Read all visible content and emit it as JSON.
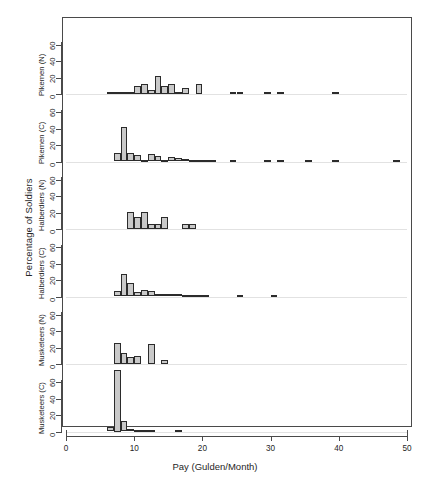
{
  "chart_data": {
    "type": "bar",
    "subtype": "histogram-small-multiples",
    "title": "",
    "xlabel": "Pay (Gulden/Month)",
    "ylabel": "Percentage of Soldiers",
    "xlim": [
      0,
      50
    ],
    "ylim": [
      0,
      80
    ],
    "xticks": [
      0,
      10,
      20,
      30,
      40,
      50
    ],
    "xticklabels": [
      "0",
      "10",
      "20",
      "30",
      "40",
      "50"
    ],
    "yticks": [
      0,
      20,
      40,
      60
    ],
    "yticklabels": [
      "0",
      "20",
      "40",
      "60"
    ],
    "grid": false,
    "legend": null,
    "bin_width": 1,
    "bar_fill": "#c9c9c9",
    "bar_edge": "#2b2b2b",
    "panels": [
      {
        "label": "Pikemen (N)",
        "order": 1,
        "bins": [
          {
            "x": 6,
            "value": 1.5
          },
          {
            "x": 7,
            "value": 2.0
          },
          {
            "x": 8,
            "value": 1.0
          },
          {
            "x": 9,
            "value": 1.5
          },
          {
            "x": 10,
            "value": 10.0
          },
          {
            "x": 11,
            "value": 12.0
          },
          {
            "x": 12,
            "value": 4.5
          },
          {
            "x": 13,
            "value": 22.0
          },
          {
            "x": 14,
            "value": 10.0
          },
          {
            "x": 15,
            "value": 12.5
          },
          {
            "x": 16,
            "value": 3.0
          },
          {
            "x": 17,
            "value": 7.5
          },
          {
            "x": 19,
            "value": 12.0
          },
          {
            "x": 24,
            "value": 1.2
          },
          {
            "x": 25,
            "value": 1.2
          },
          {
            "x": 29,
            "value": 1.2
          },
          {
            "x": 31,
            "value": 1.2
          },
          {
            "x": 39,
            "value": 1.2
          }
        ]
      },
      {
        "label": "Pikemen (C)",
        "order": 2,
        "bins": [
          {
            "x": 7,
            "value": 10.0
          },
          {
            "x": 8,
            "value": 42.0
          },
          {
            "x": 9,
            "value": 10.0
          },
          {
            "x": 10,
            "value": 8.0
          },
          {
            "x": 11,
            "value": 2.0
          },
          {
            "x": 12,
            "value": 9.0
          },
          {
            "x": 13,
            "value": 7.0
          },
          {
            "x": 14,
            "value": 2.0
          },
          {
            "x": 15,
            "value": 5.0
          },
          {
            "x": 16,
            "value": 4.0
          },
          {
            "x": 17,
            "value": 2.5
          },
          {
            "x": 18,
            "value": 2.0
          },
          {
            "x": 19,
            "value": 1.5
          },
          {
            "x": 20,
            "value": 1.2
          },
          {
            "x": 21,
            "value": 1.2
          },
          {
            "x": 24,
            "value": 1.2
          },
          {
            "x": 29,
            "value": 1.2
          },
          {
            "x": 31,
            "value": 1.2
          },
          {
            "x": 35,
            "value": 1.2
          },
          {
            "x": 39,
            "value": 1.2
          },
          {
            "x": 48,
            "value": 1.2
          }
        ]
      },
      {
        "label": "Halberdiers (N)",
        "order": 3,
        "bins": [
          {
            "x": 9,
            "value": 21.0
          },
          {
            "x": 10,
            "value": 15.0
          },
          {
            "x": 11,
            "value": 21.0
          },
          {
            "x": 12,
            "value": 6.5
          },
          {
            "x": 13,
            "value": 6.5
          },
          {
            "x": 14,
            "value": 14.5
          },
          {
            "x": 17,
            "value": 6.0
          },
          {
            "x": 18,
            "value": 6.0
          }
        ]
      },
      {
        "label": "Halberdiers (C)",
        "order": 4,
        "bins": [
          {
            "x": 7,
            "value": 7.0
          },
          {
            "x": 8,
            "value": 27.0
          },
          {
            "x": 9,
            "value": 17.0
          },
          {
            "x": 10,
            "value": 5.0
          },
          {
            "x": 11,
            "value": 8.5
          },
          {
            "x": 12,
            "value": 7.0
          },
          {
            "x": 13,
            "value": 3.5
          },
          {
            "x": 14,
            "value": 2.5
          },
          {
            "x": 15,
            "value": 2.5
          },
          {
            "x": 16,
            "value": 2.5
          },
          {
            "x": 17,
            "value": 1.5
          },
          {
            "x": 18,
            "value": 1.5
          },
          {
            "x": 19,
            "value": 1.5
          },
          {
            "x": 20,
            "value": 1.5
          },
          {
            "x": 25,
            "value": 1.2
          },
          {
            "x": 30,
            "value": 1.2
          }
        ]
      },
      {
        "label": "Musketeers (N)",
        "order": 5,
        "bins": [
          {
            "x": 7,
            "value": 26.0
          },
          {
            "x": 8,
            "value": 14.0
          },
          {
            "x": 9,
            "value": 9.0
          },
          {
            "x": 10,
            "value": 9.5
          },
          {
            "x": 12,
            "value": 24.0
          },
          {
            "x": 14,
            "value": 5.0
          }
        ]
      },
      {
        "label": "Musketeers (C)",
        "order": 6,
        "bins": [
          {
            "x": 6,
            "value": 5.0
          },
          {
            "x": 7,
            "value": 75.0
          },
          {
            "x": 8,
            "value": 13.0
          },
          {
            "x": 9,
            "value": 3.5
          },
          {
            "x": 10,
            "value": 2.0
          },
          {
            "x": 11,
            "value": 1.5
          },
          {
            "x": 12,
            "value": 1.2
          },
          {
            "x": 16,
            "value": 1.2
          }
        ]
      }
    ]
  }
}
